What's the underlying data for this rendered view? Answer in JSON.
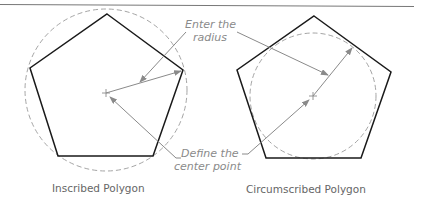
{
  "diagram": {
    "labels": {
      "radius_line1": "Enter the",
      "radius_line2": "radius",
      "center_line1": "Define the",
      "center_line2": "center point"
    },
    "captions": {
      "left": "Inscribed Polygon",
      "right": "Circumscribed Polygon"
    },
    "colors": {
      "polygon": "#1a1a1a",
      "circle": "#9a9a9a",
      "leader": "#8a8a8a",
      "rule": "#777777"
    }
  }
}
